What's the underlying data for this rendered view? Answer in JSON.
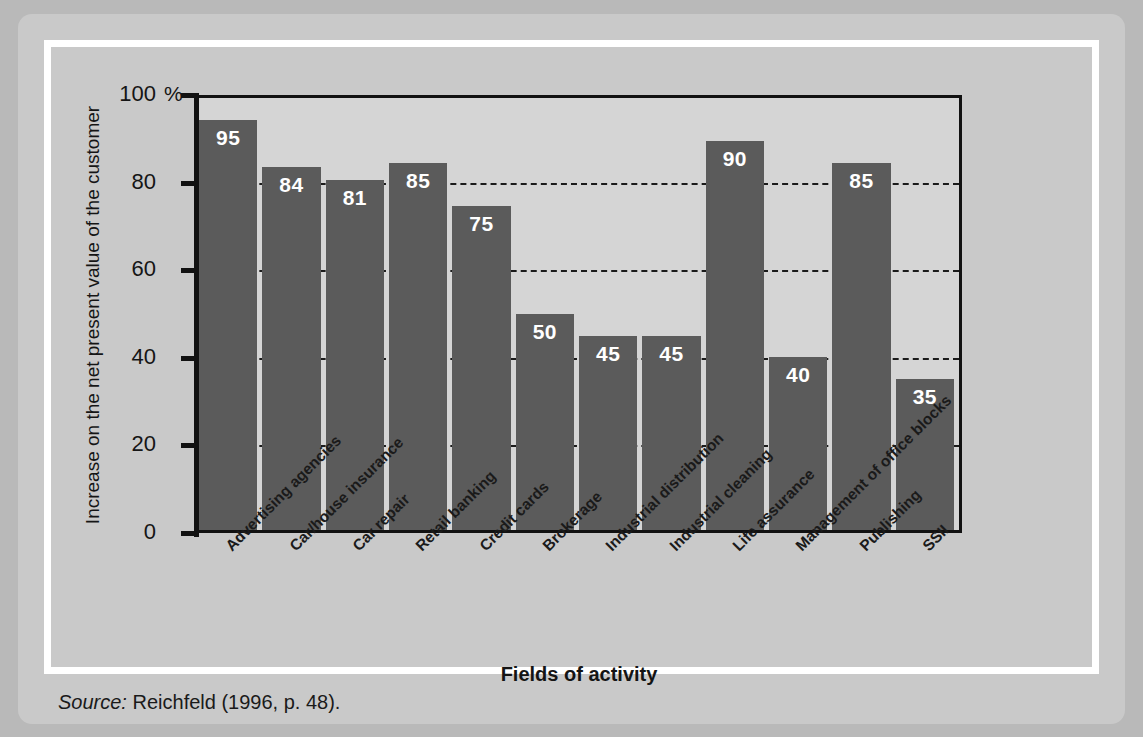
{
  "chart_data": {
    "type": "bar",
    "title": "",
    "xlabel": "Fields of activity",
    "ylabel": "Increase on the net present value of the customer",
    "unit_symbol": "%",
    "ylim": [
      0,
      100
    ],
    "yticks": [
      0,
      20,
      40,
      60,
      80,
      100
    ],
    "grid": "horizontal-dashed",
    "legend": "none",
    "categories": [
      "Advertising agencies",
      "Car/house insurance",
      "Car repair",
      "Retail banking",
      "Credit cards",
      "Brokerage",
      "Industrial distribution",
      "Industrial cleaning",
      "Life assurance",
      "Management of office blocks",
      "Publishing",
      "SSII"
    ],
    "values": [
      95,
      84,
      81,
      85,
      75,
      50,
      45,
      45,
      90,
      40,
      85,
      35
    ],
    "bar_color": "#5b5b5b",
    "value_label_color": "#ffffff",
    "plot_background": "#d5d5d5",
    "panel_background": "#c9c9c9"
  },
  "source": {
    "label": "Source:",
    "text": "Reichfeld (1996, p. 48)."
  }
}
